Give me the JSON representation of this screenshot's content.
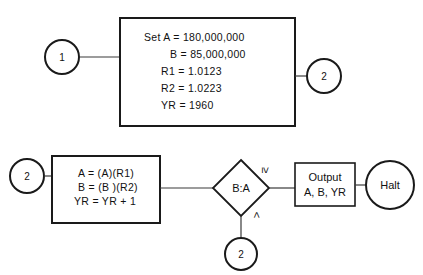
{
  "diagram": {
    "type": "flowchart",
    "nodes": {
      "connector_in_1": {
        "label": "1",
        "shape": "circle"
      },
      "init_box": {
        "shape": "rectangle",
        "lines": [
          "Set A = 180,000,000",
          "    B = 85,000,000",
          "   R1 = 1.0123",
          "   R2 = 1.0223",
          "   YR = 1960"
        ],
        "line1": "Set A = 180,000,000",
        "line2": "B = 85,000,000",
        "line3": "R1 = 1.0123",
        "line4": "R2 = 1.0223",
        "line5": "YR = 1960"
      },
      "connector_out_2": {
        "label": "2",
        "shape": "circle"
      },
      "connector_in_2": {
        "label": "2",
        "shape": "circle"
      },
      "process_box": {
        "shape": "rectangle",
        "line1": "A = (A)(R1)",
        "line2": "B = (B )(R2)",
        "line3": "YR = YR + 1"
      },
      "decision": {
        "shape": "diamond",
        "label": "B:A",
        "branch_true_label": "≥",
        "branch_false_label": "<"
      },
      "output_box": {
        "shape": "rectangle",
        "line1": "Output",
        "line2": "A, B, YR"
      },
      "halt": {
        "label": "Halt",
        "shape": "circle"
      },
      "connector_loop_2": {
        "label": "2",
        "shape": "circle"
      }
    },
    "colors": {
      "background": "#ffffff",
      "stroke": "#1a1a1a",
      "edge": "#3a3a3a",
      "text": "#111111"
    }
  }
}
